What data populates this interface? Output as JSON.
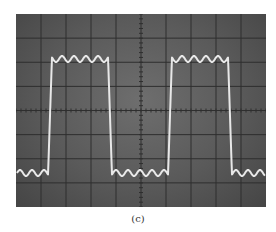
{
  "figure": {
    "caption": "(c)"
  },
  "screen": {
    "divisions_x": 10,
    "divisions_y": 8,
    "minor_ticks_per_division": 5,
    "colors": {
      "graticule": "#2e2e2e",
      "trace": "#e8e8e8",
      "background_center": "#6e6e6e",
      "background_edge": "#454545"
    }
  },
  "waveform": {
    "type": "square-wave-with-ripple",
    "period_px": 120,
    "rising_edges_x": [
      34,
      154
    ],
    "falling_edges_x": [
      94,
      214
    ],
    "high_level_y": 42,
    "low_level_y": 162,
    "ripple_amplitude_px": 6,
    "ripple_cycles_per_half_period": 5
  }
}
